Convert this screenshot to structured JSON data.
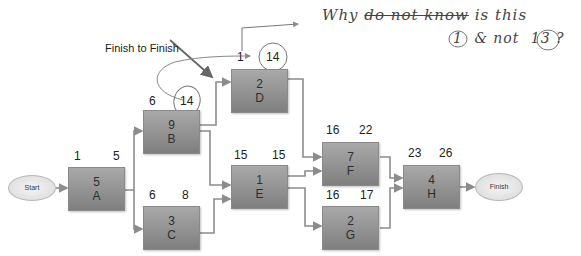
{
  "diagram": {
    "type": "network-diagram",
    "annotation_label": "Finish to Finish",
    "start_node": "Start",
    "finish_node": "Finish",
    "tasks": [
      {
        "id": "A",
        "duration": "5",
        "early_start": "1",
        "early_finish": "5"
      },
      {
        "id": "B",
        "duration": "9",
        "early_start": "6",
        "early_finish": "14"
      },
      {
        "id": "C",
        "duration": "3",
        "early_start": "6",
        "early_finish": "8"
      },
      {
        "id": "D",
        "duration": "2",
        "early_start": "1",
        "early_finish": "14"
      },
      {
        "id": "E",
        "duration": "1",
        "early_start": "15",
        "early_finish": "15"
      },
      {
        "id": "F",
        "duration": "7",
        "early_start": "16",
        "early_finish": "22"
      },
      {
        "id": "G",
        "duration": "2",
        "early_start": "16",
        "early_finish": "17"
      },
      {
        "id": "H",
        "duration": "4",
        "early_start": "23",
        "early_finish": "26"
      }
    ],
    "edges": [
      [
        "Start",
        "A"
      ],
      [
        "A",
        "B"
      ],
      [
        "A",
        "C"
      ],
      [
        "B",
        "D"
      ],
      [
        "B",
        "E"
      ],
      [
        "C",
        "E"
      ],
      [
        "D",
        "F"
      ],
      [
        "E",
        "F"
      ],
      [
        "E",
        "G"
      ],
      [
        "F",
        "H"
      ],
      [
        "G",
        "H"
      ],
      [
        "H",
        "Finish"
      ]
    ],
    "handwriting": {
      "line1_prefix": "Why",
      "line1_struck": "do not know",
      "line1_suffix": "is this",
      "line2_circled_a": "1",
      "line2_mid": "& not",
      "line2_circled_b": "13",
      "line2_end": "?"
    }
  }
}
